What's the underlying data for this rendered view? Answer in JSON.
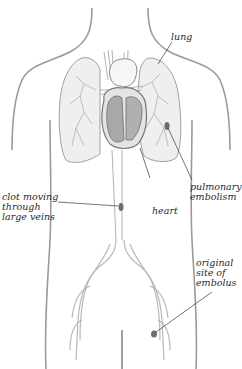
{
  "figure": {
    "colors": {
      "outline": "#8a8a8a",
      "lung_fill": "#ececec",
      "heart_fill": "#a9a9a9",
      "heart_light": "#d8d8d8",
      "clot": "#6d6d6d",
      "leader": "#3a3a3a"
    }
  },
  "labels": {
    "lung": "lung",
    "pulmonary_embolism": "pulmonary\nembolism",
    "heart": "heart",
    "clot_moving": "clot moving\nthrough\nlarge veins",
    "original_site": "original\nsite of\nembolus"
  }
}
